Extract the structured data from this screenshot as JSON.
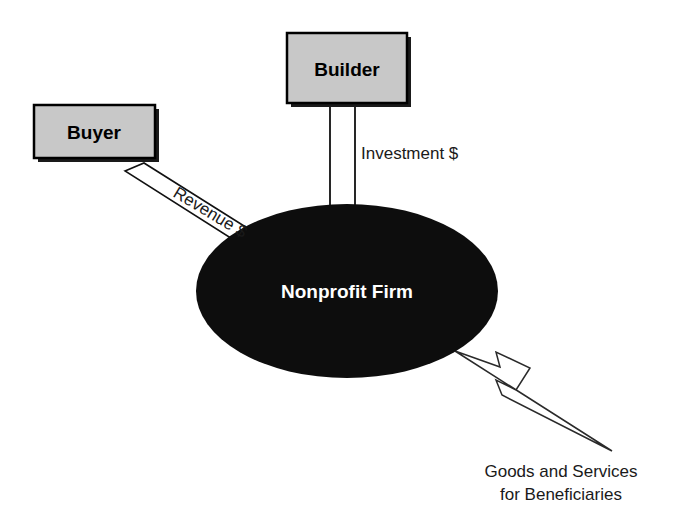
{
  "diagram": {
    "background_color": "#ffffff",
    "nodes": {
      "buyer": {
        "label": "Buyer",
        "shape": "rectangle",
        "fill_color": "#c8c8c8",
        "border_color": "#000000",
        "shadow_color": "#1a1a1a"
      },
      "builder": {
        "label": "Builder",
        "shape": "rectangle",
        "fill_color": "#c8c8c8",
        "border_color": "#000000",
        "shadow_color": "#1a1a1a"
      },
      "firm": {
        "label": "Nonprofit Firm",
        "shape": "ellipse",
        "fill_color": "#0d0d0d",
        "text_color": "#ffffff"
      }
    },
    "flows": {
      "revenue": {
        "label": "Revenue $",
        "from": "Buyer",
        "to": "Nonprofit Firm",
        "style": "hollow-block-arrow",
        "fill_color": "#ffffff",
        "stroke_color": "#000000"
      },
      "investment": {
        "label": "Investment $",
        "from": "Builder",
        "to": "Nonprofit Firm",
        "style": "hollow-block-arrow",
        "fill_color": "#ffffff",
        "stroke_color": "#000000"
      },
      "output": {
        "label_line1": "Goods and Services",
        "label_line2": "for Beneficiaries",
        "from": "Nonprofit Firm",
        "to": "Beneficiaries",
        "style": "hollow-tapered-arrow",
        "fill_color": "#ffffff",
        "stroke_color": "#1a1a1a"
      }
    }
  }
}
